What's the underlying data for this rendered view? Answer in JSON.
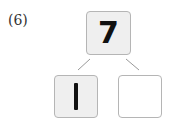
{
  "problem": {
    "label": "(6)",
    "top_value": "7",
    "left_value": "1",
    "right_value": ""
  },
  "colors": {
    "box_fill": "#efefef",
    "box_border": "#b5b5b5",
    "line": "#999999"
  }
}
